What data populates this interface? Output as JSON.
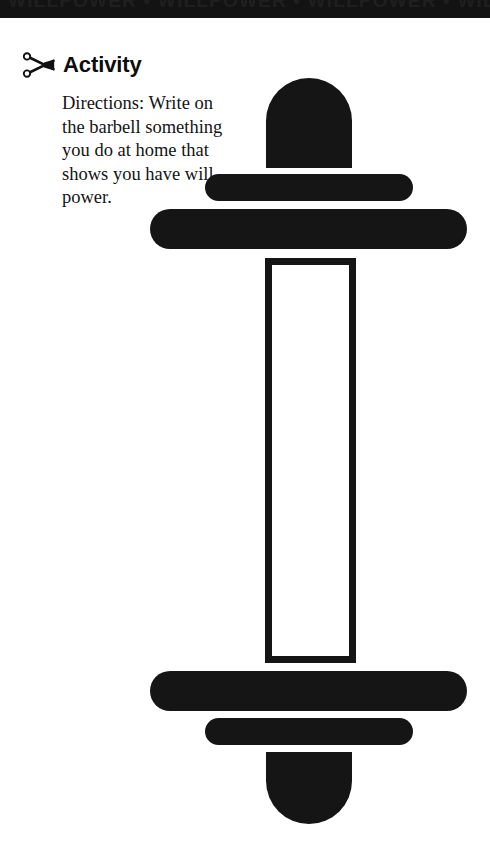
{
  "page": {
    "background_color": "#ffffff",
    "width": 490,
    "height": 850
  },
  "banner": {
    "text": "WILLPOWER  •  WILLPOWER  •  WILLPOWER  •  WILL",
    "background_color": "#131313",
    "icon_name": "decorative-banner-stripe"
  },
  "activity": {
    "icon_name": "scissors-icon",
    "title": "Activity",
    "directions": "Directions: Write on the barbell something you do at home that shows you have will power."
  },
  "barbell": {
    "color": "#151515",
    "fill_color": "#ffffff",
    "write_area_hint": "",
    "parts": {
      "top_cap": "top-end-cap",
      "top_inner_plate": "top-inner-weight-plate",
      "top_outer_plate": "top-outer-weight-plate",
      "bar": "writing-bar",
      "bottom_outer_plate": "bottom-outer-weight-plate",
      "bottom_inner_plate": "bottom-inner-weight-plate",
      "bottom_cap": "bottom-end-cap"
    }
  }
}
